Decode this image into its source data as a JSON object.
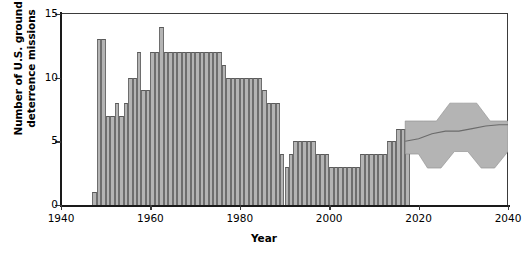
{
  "chart_data": {
    "type": "bar",
    "title": "",
    "xlabel": "Year",
    "ylabel_line1": "Number of U.S. ground",
    "ylabel_line2": "deterrence missions",
    "xlim": [
      1940,
      2040
    ],
    "ylim": [
      0,
      15
    ],
    "xticks": [
      1940,
      1960,
      1980,
      2000,
      2020,
      2040
    ],
    "yticks": [
      0,
      5,
      10,
      15
    ],
    "grid": false,
    "legend": "none",
    "bar_color": "#b4b4b4",
    "band_color": "#b4b4b4",
    "series_name": "Historical ground deterrence missions",
    "x": [
      1947,
      1948,
      1949,
      1950,
      1951,
      1952,
      1953,
      1954,
      1955,
      1956,
      1957,
      1958,
      1959,
      1960,
      1961,
      1962,
      1963,
      1964,
      1965,
      1966,
      1967,
      1968,
      1969,
      1970,
      1971,
      1972,
      1973,
      1974,
      1975,
      1976,
      1977,
      1978,
      1979,
      1980,
      1981,
      1982,
      1983,
      1984,
      1985,
      1986,
      1987,
      1988,
      1989,
      1990,
      1991,
      1992,
      1993,
      1994,
      1995,
      1996,
      1997,
      1998,
      1999,
      2000,
      2001,
      2002,
      2003,
      2004,
      2005,
      2006,
      2007,
      2008,
      2009,
      2010,
      2011,
      2012,
      2013,
      2014,
      2015,
      2016,
      2017
    ],
    "values": [
      1,
      13,
      13,
      7,
      7,
      8,
      7,
      8,
      10,
      10,
      12,
      9,
      9,
      12,
      12,
      14,
      12,
      12,
      12,
      12,
      12,
      12,
      12,
      12,
      12,
      12,
      12,
      12,
      12,
      11,
      10,
      10,
      10,
      10,
      10,
      10,
      10,
      10,
      9,
      8,
      8,
      8,
      4,
      3,
      4,
      5,
      5,
      5,
      5,
      5,
      4,
      4,
      4,
      3,
      3,
      3,
      3,
      3,
      3,
      3,
      4,
      4,
      4,
      4,
      4,
      4,
      5,
      5,
      6,
      6,
      6
    ],
    "projection": {
      "name": "Projected range",
      "x_start": 2017,
      "x_end": 2040,
      "median_x": [
        2017,
        2020,
        2023,
        2026,
        2029,
        2032,
        2035,
        2038,
        2040
      ],
      "median_y": [
        5.0,
        5.2,
        5.6,
        5.8,
        5.8,
        6.0,
        6.2,
        6.3,
        6.3
      ],
      "lower_x": [
        2017,
        2020,
        2022,
        2025,
        2028,
        2031,
        2034,
        2037,
        2040
      ],
      "lower_y": [
        4.0,
        4.0,
        2.9,
        2.9,
        4.2,
        4.2,
        2.9,
        2.9,
        4.2
      ],
      "upper_x": [
        2017,
        2021,
        2024,
        2027,
        2030,
        2033,
        2036,
        2040
      ],
      "upper_y": [
        6.6,
        6.6,
        6.6,
        8.0,
        8.0,
        8.0,
        6.6,
        6.6
      ]
    }
  },
  "axis": {
    "y_tick_labels": [
      "0",
      "5",
      "10",
      "15"
    ],
    "x_tick_labels": [
      "1940",
      "1960",
      "1980",
      "2000",
      "2020",
      "2040"
    ],
    "x_title": "Year",
    "y_title_line1": "Number of U.S. ground",
    "y_title_line2": "deterrence missions"
  }
}
